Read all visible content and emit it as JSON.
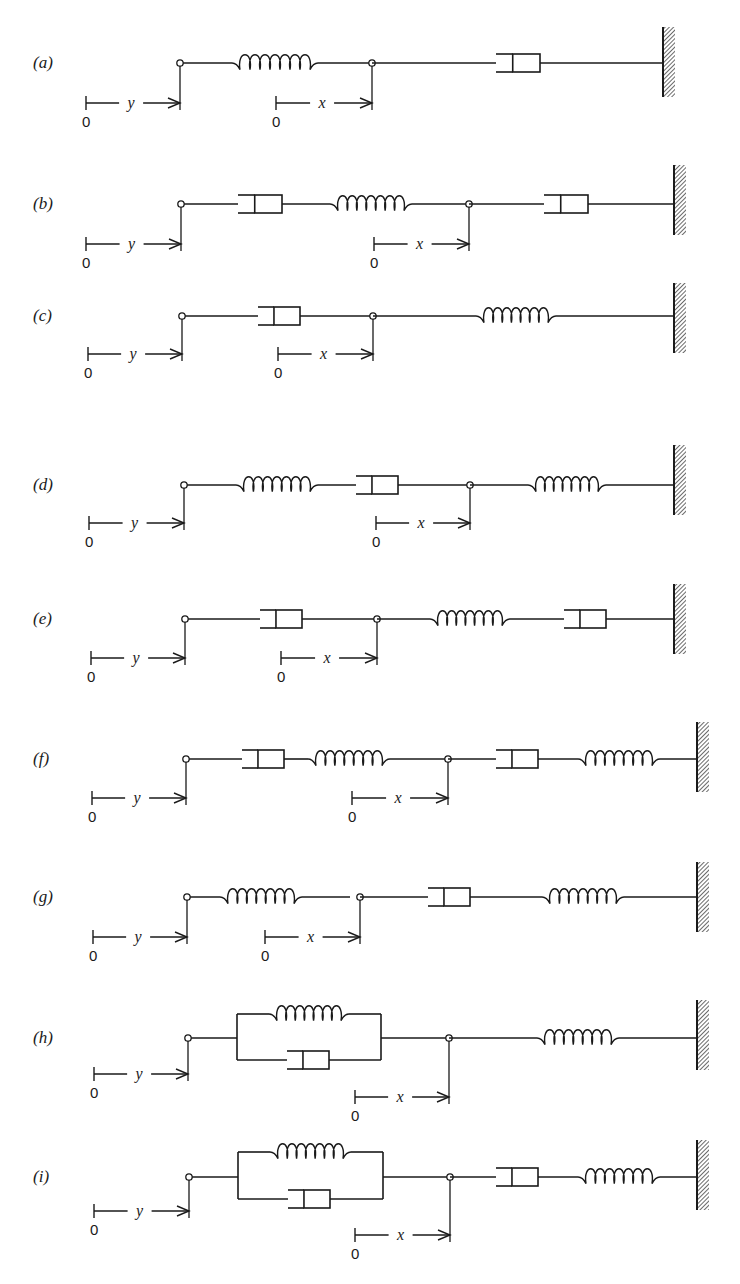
{
  "figure": {
    "colors": {
      "ink": "#1a1a1a",
      "paper": "#ffffff"
    },
    "arrow_labels": {
      "input": "y",
      "output": "x",
      "origin": "0"
    },
    "diagrams": [
      {
        "id": "a",
        "label": "(a)",
        "line_y": 63,
        "input_x": 180,
        "output_x": 372,
        "wall_x": 663,
        "wall_top": 27,
        "wall_bottom": 97,
        "y_arrow": {
          "x0": 86,
          "y": 103
        },
        "x_arrow": {
          "x0": 276,
          "y": 103
        },
        "chain": [
          {
            "type": "wire",
            "from": 180,
            "to": 232
          },
          {
            "type": "spring",
            "from": 232,
            "to": 318
          },
          {
            "type": "wire",
            "from": 318,
            "to": 372
          },
          {
            "type": "node",
            "at": 372
          },
          {
            "type": "wire",
            "from": 372,
            "to": 496
          },
          {
            "type": "dashpot",
            "from": 496,
            "to": 540
          },
          {
            "type": "wire",
            "from": 540,
            "to": 663
          }
        ]
      },
      {
        "id": "b",
        "label": "(b)",
        "line_y": 204,
        "input_x": 181,
        "output_x": 469,
        "wall_x": 674,
        "wall_top": 165,
        "wall_bottom": 235,
        "y_arrow": {
          "x0": 86,
          "y": 244
        },
        "x_arrow": {
          "x0": 374,
          "y": 244
        },
        "chain": [
          {
            "type": "wire",
            "from": 181,
            "to": 238
          },
          {
            "type": "dashpot",
            "from": 238,
            "to": 282
          },
          {
            "type": "wire",
            "from": 282,
            "to": 330
          },
          {
            "type": "spring",
            "from": 330,
            "to": 412
          },
          {
            "type": "wire",
            "from": 412,
            "to": 469
          },
          {
            "type": "node",
            "at": 469
          },
          {
            "type": "wire",
            "from": 469,
            "to": 544
          },
          {
            "type": "dashpot",
            "from": 544,
            "to": 588
          },
          {
            "type": "wire",
            "from": 588,
            "to": 674
          }
        ]
      },
      {
        "id": "c",
        "label": "(c)",
        "line_y": 316,
        "input_x": 182,
        "output_x": 373,
        "wall_x": 674,
        "wall_top": 283,
        "wall_bottom": 353,
        "y_arrow": {
          "x0": 88,
          "y": 354
        },
        "x_arrow": {
          "x0": 278,
          "y": 354
        },
        "chain": [
          {
            "type": "wire",
            "from": 182,
            "to": 258
          },
          {
            "type": "dashpot",
            "from": 258,
            "to": 300
          },
          {
            "type": "wire",
            "from": 300,
            "to": 373
          },
          {
            "type": "node",
            "at": 373
          },
          {
            "type": "wire",
            "from": 373,
            "to": 476
          },
          {
            "type": "spring",
            "from": 476,
            "to": 556
          },
          {
            "type": "wire",
            "from": 556,
            "to": 674
          }
        ]
      },
      {
        "id": "d",
        "label": "(d)",
        "line_y": 485,
        "input_x": 184,
        "output_x": 470,
        "wall_x": 674,
        "wall_top": 445,
        "wall_bottom": 515,
        "y_arrow": {
          "x0": 89,
          "y": 523
        },
        "x_arrow": {
          "x0": 376,
          "y": 523
        },
        "chain": [
          {
            "type": "wire",
            "from": 184,
            "to": 236
          },
          {
            "type": "spring",
            "from": 236,
            "to": 318
          },
          {
            "type": "wire",
            "from": 318,
            "to": 356
          },
          {
            "type": "dashpot",
            "from": 356,
            "to": 398
          },
          {
            "type": "wire",
            "from": 398,
            "to": 470
          },
          {
            "type": "node",
            "at": 470
          },
          {
            "type": "wire",
            "from": 470,
            "to": 528
          },
          {
            "type": "spring",
            "from": 528,
            "to": 606
          },
          {
            "type": "wire",
            "from": 606,
            "to": 674
          }
        ]
      },
      {
        "id": "e",
        "label": "(e)",
        "line_y": 619,
        "input_x": 185,
        "output_x": 377,
        "wall_x": 674,
        "wall_top": 584,
        "wall_bottom": 654,
        "y_arrow": {
          "x0": 91,
          "y": 658
        },
        "x_arrow": {
          "x0": 281,
          "y": 658
        },
        "chain": [
          {
            "type": "wire",
            "from": 185,
            "to": 260
          },
          {
            "type": "dashpot",
            "from": 260,
            "to": 302
          },
          {
            "type": "wire",
            "from": 302,
            "to": 377
          },
          {
            "type": "node",
            "at": 377
          },
          {
            "type": "wire",
            "from": 377,
            "to": 430
          },
          {
            "type": "spring",
            "from": 430,
            "to": 510
          },
          {
            "type": "wire",
            "from": 510,
            "to": 564
          },
          {
            "type": "dashpot",
            "from": 564,
            "to": 606
          },
          {
            "type": "wire",
            "from": 606,
            "to": 674
          }
        ]
      },
      {
        "id": "f",
        "label": "(f)",
        "line_y": 759,
        "input_x": 186,
        "output_x": 448,
        "wall_x": 697,
        "wall_top": 722,
        "wall_bottom": 792,
        "y_arrow": {
          "x0": 92,
          "y": 798
        },
        "x_arrow": {
          "x0": 352,
          "y": 798
        },
        "chain": [
          {
            "type": "wire",
            "from": 186,
            "to": 242
          },
          {
            "type": "dashpot",
            "from": 242,
            "to": 284
          },
          {
            "type": "wire",
            "from": 284,
            "to": 308
          },
          {
            "type": "spring",
            "from": 308,
            "to": 390
          },
          {
            "type": "wire",
            "from": 390,
            "to": 448
          },
          {
            "type": "node",
            "at": 448
          },
          {
            "type": "wire",
            "from": 448,
            "to": 496
          },
          {
            "type": "dashpot",
            "from": 496,
            "to": 538
          },
          {
            "type": "wire",
            "from": 538,
            "to": 578
          },
          {
            "type": "spring",
            "from": 578,
            "to": 660
          },
          {
            "type": "wire",
            "from": 660,
            "to": 697
          }
        ]
      },
      {
        "id": "g",
        "label": "(g)",
        "line_y": 897,
        "input_x": 187,
        "output_x": 360,
        "wall_x": 697,
        "wall_top": 862,
        "wall_bottom": 932,
        "y_arrow": {
          "x0": 93,
          "y": 937
        },
        "x_arrow": {
          "x0": 265,
          "y": 937
        },
        "chain": [
          {
            "type": "wire",
            "from": 187,
            "to": 220
          },
          {
            "type": "spring",
            "from": 220,
            "to": 302
          },
          {
            "type": "wire",
            "from": 302,
            "to": 350
          },
          {
            "type": "gap",
            "from": 350,
            "to": 360
          },
          {
            "type": "node",
            "at": 360
          },
          {
            "type": "wire",
            "from": 360,
            "to": 428
          },
          {
            "type": "dashpot",
            "from": 428,
            "to": 470
          },
          {
            "type": "wire",
            "from": 470,
            "to": 542
          },
          {
            "type": "spring",
            "from": 542,
            "to": 624
          },
          {
            "type": "wire",
            "from": 624,
            "to": 697
          }
        ]
      },
      {
        "id": "h",
        "label": "(h)",
        "line_y": 1038,
        "input_x": 188,
        "output_x": 449,
        "wall_x": 697,
        "wall_top": 1000,
        "wall_bottom": 1070,
        "y_arrow": {
          "x0": 94,
          "y": 1074
        },
        "x_arrow": {
          "x0": 355,
          "y": 1097
        },
        "parallel": {
          "from": 237,
          "to": 381,
          "top_y": 1014,
          "bottom_y": 1060,
          "spring": {
            "from": 269,
            "to": 349
          },
          "dashpot": {
            "from": 287,
            "to": 329
          }
        },
        "chain": [
          {
            "type": "wire",
            "from": 188,
            "to": 237
          },
          {
            "type": "parallel",
            "from": 237,
            "to": 381
          },
          {
            "type": "wire",
            "from": 381,
            "to": 449
          },
          {
            "type": "node",
            "at": 449
          },
          {
            "type": "wire",
            "from": 449,
            "to": 537
          },
          {
            "type": "spring",
            "from": 537,
            "to": 619
          },
          {
            "type": "wire",
            "from": 619,
            "to": 697
          }
        ]
      },
      {
        "id": "i",
        "label": "(i)",
        "line_y": 1177,
        "input_x": 189,
        "output_x": 450,
        "wall_x": 697,
        "wall_top": 1140,
        "wall_bottom": 1210,
        "y_arrow": {
          "x0": 94,
          "y": 1211
        },
        "x_arrow": {
          "x0": 355,
          "y": 1235
        },
        "parallel": {
          "from": 238,
          "to": 383,
          "top_y": 1152,
          "bottom_y": 1199,
          "spring": {
            "from": 270,
            "to": 351
          },
          "dashpot": {
            "from": 288,
            "to": 330
          }
        },
        "chain": [
          {
            "type": "wire",
            "from": 189,
            "to": 238
          },
          {
            "type": "parallel",
            "from": 238,
            "to": 383
          },
          {
            "type": "wire",
            "from": 383,
            "to": 450
          },
          {
            "type": "node",
            "at": 450
          },
          {
            "type": "wire",
            "from": 450,
            "to": 496
          },
          {
            "type": "dashpot",
            "from": 496,
            "to": 538
          },
          {
            "type": "wire",
            "from": 538,
            "to": 578
          },
          {
            "type": "spring",
            "from": 578,
            "to": 660
          },
          {
            "type": "wire",
            "from": 660,
            "to": 697
          }
        ]
      }
    ]
  }
}
